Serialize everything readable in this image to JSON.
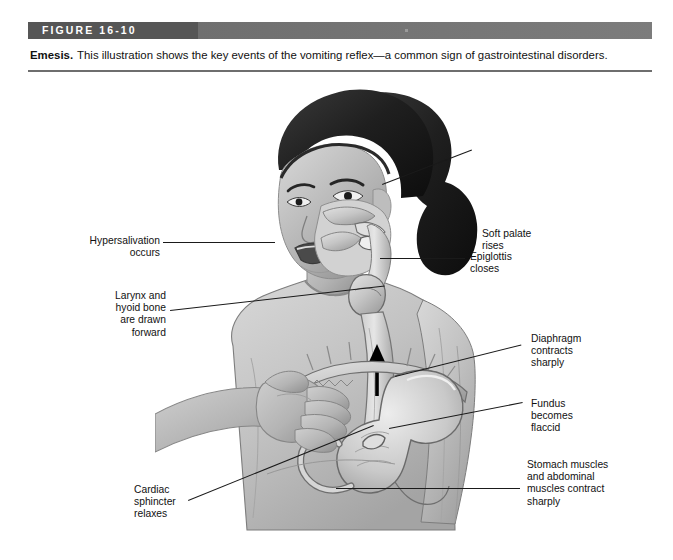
{
  "figure": {
    "bar_label": "FIGURE 16-10",
    "caption_lead": "Emesis.",
    "caption_body": "This illustration shows the key events of the vomiting reflex—a common sign of gastrointestinal disorders."
  },
  "colors": {
    "bar_dark": "#565656",
    "bar_light": "#7c7c7c",
    "bar_text": "#ffffff",
    "rule": "#6e6e6e",
    "text": "#111111",
    "leader": "#1a1a1a",
    "page_background": "#ffffff"
  },
  "illustration": {
    "alt": "Grayscale medical illustration of a girl vomiting, cutaway view of head, esophagus, diaphragm and stomach",
    "arrow_icon": "up-arrow-icon",
    "arrow_meaning": "Direction of gastric contents moving up the esophagus"
  },
  "callouts": [
    {
      "id": "soft-palate",
      "name": "callout-soft-palate",
      "lines": [
        "Soft palate",
        "rises"
      ],
      "text": "Soft palate\nrises",
      "align": "left"
    },
    {
      "id": "hypersalivation",
      "name": "callout-hypersalivation",
      "lines": [
        "Hypersalivation",
        "occurs"
      ],
      "text": "Hypersalivation\noccurs",
      "align": "right"
    },
    {
      "id": "epiglottis",
      "name": "callout-epiglottis",
      "lines": [
        "Epiglottis",
        "closes"
      ],
      "text": "Epiglottis\ncloses",
      "align": "left"
    },
    {
      "id": "larynx-hyoid",
      "name": "callout-larynx-hyoid",
      "lines": [
        "Larynx and",
        "hyoid bone",
        "are drawn",
        "forward"
      ],
      "text": "Larynx and\nhyoid bone\nare drawn\nforward",
      "align": "right"
    },
    {
      "id": "diaphragm",
      "name": "callout-diaphragm",
      "lines": [
        "Diaphragm",
        "contracts",
        "sharply"
      ],
      "text": "Diaphragm\ncontracts\nsharply",
      "align": "left"
    },
    {
      "id": "fundus",
      "name": "callout-fundus",
      "lines": [
        "Fundus",
        "becomes",
        "flaccid"
      ],
      "text": "Fundus\nbecomes\nflaccid",
      "align": "left"
    },
    {
      "id": "stomach-muscles",
      "name": "callout-stomach-muscles",
      "lines": [
        "Stomach muscles",
        "and abdominal",
        "muscles contract",
        "sharply"
      ],
      "text": "Stomach muscles\nand abdominal\nmuscles contract\nsharply",
      "align": "left"
    },
    {
      "id": "cardiac-sphincter",
      "name": "callout-cardiac-sphincter",
      "lines": [
        "Cardiac",
        "sphincter",
        "relaxes"
      ],
      "text": "Cardiac\nsphincter\nrelaxes",
      "align": "left"
    }
  ]
}
